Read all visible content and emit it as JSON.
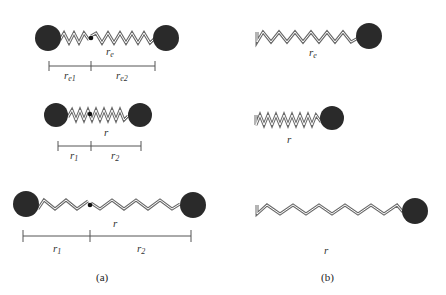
{
  "colors": {
    "ball": "#2a2a2a",
    "spring_outer": "#6a6a6a",
    "spring_inner": "#ffffff",
    "bar": "#555555",
    "dot": "#111111"
  },
  "panel_a": {
    "caption": "(a)",
    "rows": [
      {
        "length_label": "r",
        "length_sub": "e",
        "part1_label": "r",
        "part1_sub": "e1",
        "part2_label": "r",
        "part2_sub": "e2"
      },
      {
        "length_label": "r",
        "length_sub": "",
        "part1_label": "r",
        "part1_sub": "1",
        "part2_label": "r",
        "part2_sub": "2"
      },
      {
        "length_label": "r",
        "length_sub": "",
        "part1_label": "r",
        "part1_sub": "1",
        "part2_label": "r",
        "part2_sub": "2"
      }
    ]
  },
  "panel_b": {
    "caption": "(b)",
    "rows": [
      {
        "length_label": "r",
        "length_sub": "e"
      },
      {
        "length_label": "r",
        "length_sub": ""
      },
      {
        "length_label": "r",
        "length_sub": ""
      }
    ]
  }
}
